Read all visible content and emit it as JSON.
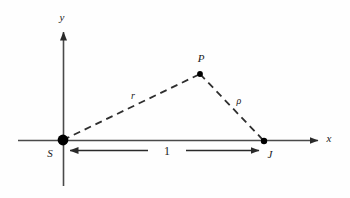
{
  "figure": {
    "type": "geometry-diagram",
    "background_color": "#fefefe",
    "stroke_color": "#3a3a3a",
    "marker_color": "#000000",
    "axes": {
      "x_axis_label": "x",
      "y_axis_label": "y",
      "origin_name": "S"
    },
    "points": [
      {
        "id": "S",
        "label": "S",
        "x": 63,
        "y": 140,
        "marker": "large-filled-dot"
      },
      {
        "id": "P",
        "label": "P",
        "x": 200,
        "y": 74,
        "marker": "small-filled-dot"
      },
      {
        "id": "J",
        "label": "J",
        "x": 264,
        "y": 141,
        "marker": "small-filled-dot"
      }
    ],
    "segments": [
      {
        "id": "SP",
        "label": "r",
        "from": "S",
        "to": "P",
        "style": "dashed"
      },
      {
        "id": "PJ",
        "label": "ρ",
        "from": "P",
        "to": "J",
        "style": "dashed"
      }
    ],
    "measurement": {
      "label": "1",
      "from": "S",
      "to": "J",
      "style": "double-headed-arrow"
    }
  }
}
